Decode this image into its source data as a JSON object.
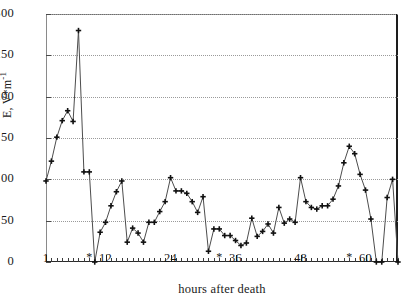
{
  "chart_data": {
    "type": "line",
    "title": "",
    "xlabel": "hours after death",
    "ylabel": "E, V*m-1",
    "ylabel_base": "E, V*m",
    "ylabel_exp": "-1",
    "xlim": [
      1,
      66
    ],
    "ylim": [
      0,
      300
    ],
    "grid": true,
    "legend": null,
    "marker": "plus",
    "y_ticks": [
      0,
      50,
      100,
      150,
      200,
      250,
      300
    ],
    "y_tick_labels": [
      "0",
      "50",
      "100",
      "150",
      "200",
      "250",
      "300"
    ],
    "x_ticks": [
      1,
      12,
      24,
      36,
      48,
      60
    ],
    "x_tick_labels": [
      "1",
      "12",
      "24",
      "36",
      "48",
      "60"
    ],
    "x_star_marker": "*",
    "x_star_positions": [
      9,
      33,
      57
    ],
    "x_minor_tick_interval": 1,
    "x": [
      1,
      2,
      3,
      4,
      5,
      6,
      7,
      8,
      9,
      10,
      11,
      12,
      13,
      14,
      15,
      16,
      17,
      18,
      19,
      20,
      21,
      22,
      23,
      24,
      25,
      26,
      27,
      28,
      29,
      30,
      31,
      32,
      33,
      34,
      35,
      36,
      37,
      38,
      39,
      40,
      41,
      42,
      43,
      44,
      45,
      46,
      47,
      48,
      49,
      50,
      51,
      52,
      53,
      54,
      55,
      56,
      57,
      58,
      59,
      60,
      61,
      62,
      63,
      64,
      65,
      66
    ],
    "values": [
      98,
      122,
      151,
      171,
      183,
      170,
      280,
      109,
      109,
      0,
      36,
      48,
      68,
      85,
      98,
      24,
      41,
      35,
      24,
      48,
      48,
      61,
      73,
      102,
      86,
      86,
      83,
      73,
      60,
      79,
      13,
      40,
      40,
      32,
      32,
      26,
      20,
      23,
      53,
      31,
      37,
      46,
      35,
      66,
      47,
      52,
      48,
      102,
      73,
      66,
      64,
      68,
      68,
      76,
      92,
      120,
      140,
      131,
      106,
      87,
      52,
      0,
      0,
      78,
      100,
      0
    ]
  },
  "axis": {
    "y_title": "E, V*m-1",
    "x_title": "hours after death"
  }
}
